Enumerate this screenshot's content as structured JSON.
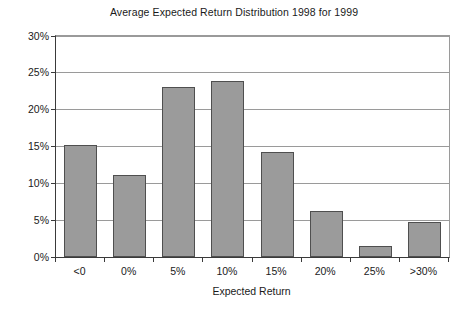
{
  "chart_data": {
    "type": "bar",
    "title": "Average Expected Return Distribution 1998 for 1999",
    "xlabel": "Expected Return",
    "ylabel": "",
    "categories": [
      "<0",
      "0%",
      "5%",
      "10%",
      "15%",
      "20%",
      "25%",
      ">30%"
    ],
    "values": [
      15.2,
      11.2,
      23.1,
      23.9,
      14.2,
      6.3,
      1.5,
      4.8
    ],
    "ylim": [
      0,
      30
    ],
    "ytick_values": [
      0,
      5,
      10,
      15,
      20,
      25,
      30
    ],
    "ytick_labels": [
      "0%",
      "5%",
      "10%",
      "15%",
      "20%",
      "25%",
      "30%"
    ],
    "grid": true,
    "legend": false,
    "bar_color": "#9b9b9b",
    "bar_border_color": "#4f4f4f",
    "gridline_color": "#9a9a9a",
    "axis_color": "#3a3a3a",
    "background_color": "#ffffff"
  }
}
